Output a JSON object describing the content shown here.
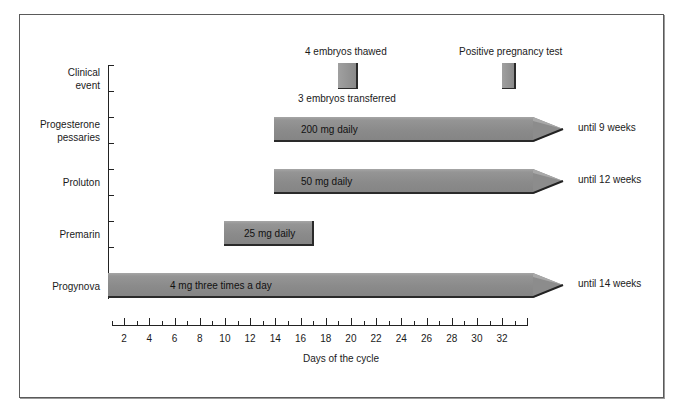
{
  "chart_data": {
    "type": "gantt",
    "title": "",
    "xlabel": "Days of the cycle",
    "ylabel": "",
    "xlim": [
      1,
      34
    ],
    "x_ticks": [
      2,
      4,
      6,
      8,
      10,
      12,
      14,
      16,
      18,
      20,
      22,
      24,
      26,
      28,
      30,
      32
    ],
    "rows": [
      {
        "name": "Clinical event",
        "lines": [
          "Clinical",
          "event"
        ]
      },
      {
        "name": "Progesterone pessaries",
        "lines": [
          "Progesterone",
          "pessaries"
        ]
      },
      {
        "name": "Proluton",
        "lines": [
          "Proluton"
        ]
      },
      {
        "name": "Premarin",
        "lines": [
          "Premarin"
        ]
      },
      {
        "name": "Progynova",
        "lines": [
          "Progynova"
        ]
      }
    ],
    "events": [
      {
        "day_start": 19,
        "day_end": 20.5,
        "label_above": "4 embryos thawed",
        "label_below": "3 embryos transferred"
      },
      {
        "day_start": 32,
        "day_end": 33,
        "label_above": "Positive pregnancy test"
      }
    ],
    "treatments": [
      {
        "row": "Progesterone pessaries",
        "start_day": 14,
        "end_day": 34,
        "dose": "200 mg daily",
        "continues": true,
        "until": "until 9 weeks"
      },
      {
        "row": "Proluton",
        "start_day": 14,
        "end_day": 34,
        "dose": "50 mg daily",
        "continues": true,
        "until": "until 12 weeks"
      },
      {
        "row": "Premarin",
        "start_day": 10,
        "end_day": 17,
        "dose": "25 mg daily",
        "continues": false
      },
      {
        "row": "Progynova",
        "start_day": 1,
        "end_day": 34,
        "dose": "4 mg three times a day",
        "continues": true,
        "until": "until 14 weeks"
      }
    ]
  }
}
